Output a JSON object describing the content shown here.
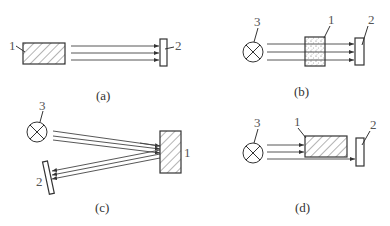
{
  "figure": {
    "panels": [
      {
        "id": "a",
        "caption": "(a)",
        "labels": {
          "object": "1",
          "detector": "2"
        },
        "description": "Hatched object 1 emits parallel rays directly to detector 2"
      },
      {
        "id": "b",
        "caption": "(b)",
        "labels": {
          "source": "3",
          "object": "1",
          "detector": "2"
        },
        "description": "Light source 3 sends rays through dotted (translucent) object 1 to detector 2"
      },
      {
        "id": "c",
        "caption": "(c)",
        "labels": {
          "source": "3",
          "object": "1",
          "detector": "2"
        },
        "description": "Light source 3 rays reflect off hatched object 1 back to tilted detector 2"
      },
      {
        "id": "d",
        "caption": "(d)",
        "labels": {
          "source": "3",
          "object": "1",
          "detector": "2"
        },
        "description": "Light source 3 rays partially blocked by hatched object 1; unblocked ray reaches detector 2"
      }
    ],
    "colors": {
      "line": "#333333",
      "label": "#555555",
      "background": "#ffffff"
    }
  }
}
